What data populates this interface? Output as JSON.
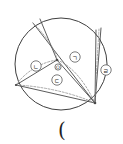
{
  "figure": {
    "background_color": "#ffffff",
    "stroke_color": "#4a4a4a",
    "dashed_stroke_color": "#8c8c8c",
    "circle": {
      "name": "main-circle",
      "center_x": 61,
      "center_y": 64,
      "radius": 46
    },
    "center_point": {
      "label": "O",
      "x": 58,
      "y": 67
    },
    "region_labels": [
      {
        "key": "giyeok",
        "text": "ㄱ",
        "x": 75,
        "y": 57
      },
      {
        "key": "nieun",
        "text": "ㄴ",
        "x": 36,
        "y": 66
      },
      {
        "key": "digeut",
        "text": "ㄷ",
        "x": 57,
        "y": 80
      },
      {
        "key": "rieul",
        "text": "ㄹ",
        "x": 106,
        "y": 70
      }
    ],
    "caption": {
      "text": "(",
      "x": 62,
      "y": 130
    }
  }
}
